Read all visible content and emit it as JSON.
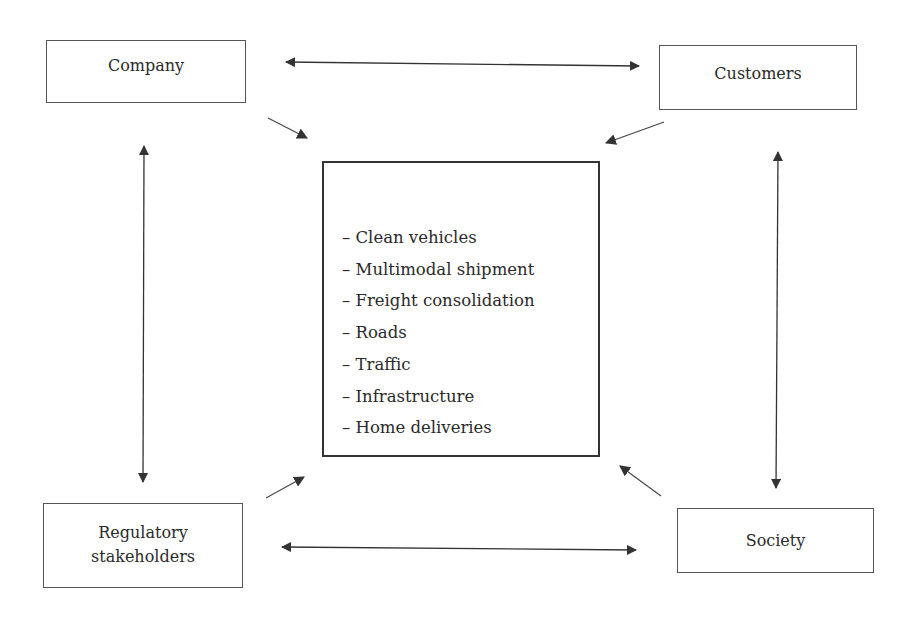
{
  "diagram": {
    "nodes": {
      "company": {
        "label": "Company"
      },
      "customers": {
        "label": "Customers"
      },
      "regulatory": {
        "line1": "Regulatory",
        "line2": "stakeholders"
      },
      "society": {
        "label": "Society"
      }
    },
    "center": {
      "items": [
        "– Clean vehicles",
        "– Multimodal shipment",
        "– Freight consolidation",
        "– Roads",
        "– Traffic",
        "– Infrastructure",
        "– Home deliveries"
      ]
    },
    "edges": [
      {
        "from": "company",
        "to": "customers",
        "type": "bidirectional"
      },
      {
        "from": "regulatory",
        "to": "society",
        "type": "bidirectional"
      },
      {
        "from": "company",
        "to": "regulatory",
        "type": "bidirectional"
      },
      {
        "from": "customers",
        "to": "society",
        "type": "bidirectional"
      },
      {
        "from": "company",
        "to": "center",
        "type": "directed"
      },
      {
        "from": "customers",
        "to": "center",
        "type": "directed"
      },
      {
        "from": "regulatory",
        "to": "center",
        "type": "directed"
      },
      {
        "from": "society",
        "to": "center",
        "type": "directed"
      }
    ],
    "colors": {
      "stroke": "#333333",
      "text": "#2a2a2a",
      "background": "#ffffff"
    }
  }
}
